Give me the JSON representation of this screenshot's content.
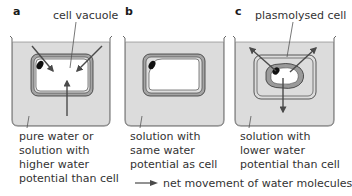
{
  "panels": [
    {
      "letter": "a",
      "callout": "cell vacuole",
      "caption": [
        "pure water or",
        "solution with",
        "higher water",
        "potential than cell"
      ],
      "state": "turgid",
      "water_direction": "into cell"
    },
    {
      "letter": "b",
      "callout": "",
      "caption": [
        "solution with",
        "same water",
        "potential as cell"
      ],
      "state": "normal",
      "water_direction": "none"
    },
    {
      "letter": "c",
      "callout": "plasmolysed cell",
      "caption": [
        "solution with",
        "lower water",
        "potential than cell"
      ],
      "state": "plasmolysed",
      "water_direction": "out of cell"
    }
  ],
  "legend": {
    "icon": "arrow-right-icon",
    "label": "net movement of water molecules"
  },
  "colors": {
    "solution_fill": "#dcdcdc",
    "beaker_outline": "#555555",
    "cell_wall_fill": "#a9a9a9",
    "cytoplasm_fill": "#e6e6e6",
    "vacuole_fill": "#ffffff",
    "nucleus_fill": "#111111",
    "arrow": "#555555"
  }
}
